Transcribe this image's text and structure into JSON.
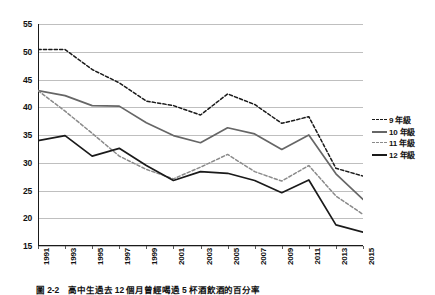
{
  "chart_data": {
    "type": "line",
    "title": "",
    "xlabel": "",
    "ylabel": "",
    "ylim": [
      15,
      55
    ],
    "ytick_step": 5,
    "grid": true,
    "legend_position": "right",
    "yticks": [
      55,
      50,
      45,
      40,
      35,
      30,
      25,
      20,
      15
    ],
    "categories": [
      "1991",
      "1993",
      "1995",
      "1997",
      "1999",
      "2001",
      "2003",
      "2005",
      "2007",
      "2009",
      "2011",
      "2013",
      "2015"
    ],
    "series": [
      {
        "name": "9 年級",
        "style": "dashed",
        "color": "#1a1a1a",
        "values": [
          50.4,
          50.4,
          46.8,
          44.4,
          41.1,
          40.3,
          38.6,
          42.4,
          40.5,
          37.1,
          38.3,
          29.0,
          27.6
        ]
      },
      {
        "name": "10 年級",
        "style": "solid",
        "color": "#666666",
        "values": [
          43.0,
          42.1,
          40.3,
          40.2,
          37.2,
          34.9,
          33.6,
          36.3,
          35.2,
          32.4,
          35.0,
          28.0,
          23.4
        ]
      },
      {
        "name": "11 年級",
        "style": "dashed",
        "color": "#8a8a8a",
        "values": [
          43.0,
          39.3,
          35.3,
          31.2,
          28.8,
          27.1,
          29.2,
          31.5,
          28.4,
          26.7,
          29.5,
          24.0,
          20.7
        ]
      },
      {
        "name": "12 年級",
        "style": "solid",
        "color": "#1a1a1a",
        "values": [
          34.0,
          34.9,
          31.2,
          32.6,
          29.5,
          26.8,
          28.4,
          28.1,
          26.8,
          24.6,
          26.9,
          18.8,
          17.5
        ]
      }
    ]
  },
  "legend": {
    "items": [
      {
        "label": "9 年級"
      },
      {
        "label": "10 年級"
      },
      {
        "label": "11 年級"
      },
      {
        "label": "12 年級"
      }
    ]
  },
  "caption": {
    "text": "圖 2-2　高中生過去 12 個月曾經喝過 5 杯酒飲酒的百分率"
  }
}
